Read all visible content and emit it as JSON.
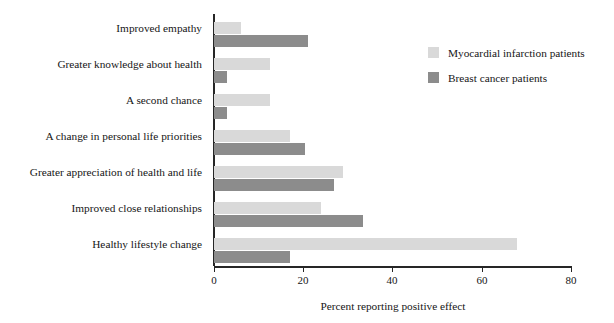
{
  "chart_data": {
    "type": "bar",
    "orientation": "horizontal",
    "title": "",
    "xlabel": "Percent reporting positive effect",
    "ylabel": "",
    "xlim": [
      0,
      80
    ],
    "xticks": [
      0,
      20,
      40,
      60,
      80
    ],
    "xtick_labels": [
      "0",
      "20",
      "40",
      "60",
      "80"
    ],
    "grid": false,
    "legend_position": "top-right",
    "categories": [
      "Improved empathy",
      "Greater knowledge about health",
      "A second chance",
      "A change in personal life priorities",
      "Greater appreciation of health and life",
      "Improved close relationships",
      "Healthy lifestyle change"
    ],
    "series": [
      {
        "name": "Myocardial infarction patients",
        "color": "#d9d9d9",
        "values": [
          6,
          12.5,
          12.5,
          17,
          29,
          24,
          68
        ]
      },
      {
        "name": "Breast cancer patients",
        "color": "#8c8c8c",
        "values": [
          21,
          3,
          3,
          20.5,
          27,
          33.5,
          17
        ]
      }
    ]
  },
  "axis": {
    "tick_0": "0",
    "tick_20": "20",
    "tick_40": "40",
    "tick_60": "60",
    "tick_80": "80",
    "x_title": "Percent reporting positive effect"
  },
  "categories": {
    "c0": "Improved empathy",
    "c1": "Greater knowledge about health",
    "c2": "A second chance",
    "c3": "A change in personal life priorities",
    "c4": "Greater appreciation of health and life",
    "c5": "Improved close relationships",
    "c6": "Healthy lifestyle change"
  },
  "legend": {
    "item_light": "Myocardial infarction patients",
    "item_dark": "Breast cancer patients"
  }
}
